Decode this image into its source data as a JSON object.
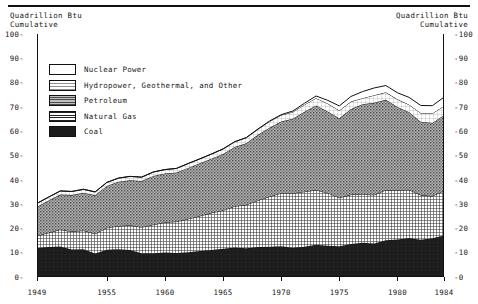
{
  "axis_titles": {
    "left": "Quadrillion Btu\nCumulative",
    "right": "Quadrillion Btu\nCumulative"
  },
  "y_ticks_left": [
    "100-",
    "90-",
    "80-",
    "70-",
    "60-",
    "50-",
    "40-",
    "30-",
    "20-",
    "10-",
    "0-"
  ],
  "y_ticks_right": [
    "-100",
    "-90",
    "-80",
    "-70",
    "-60",
    "-50",
    "-40",
    "-30",
    "-20",
    "-10",
    "-0"
  ],
  "legend": {
    "items": [
      {
        "label": "Nuclear Power",
        "pattern": "blank",
        "color": "#ffffff"
      },
      {
        "label": "Hydropower, Geothermal, and Other",
        "pattern": "fine-grid",
        "color": "#f2f2f2"
      },
      {
        "label": "Petroleum",
        "pattern": "stipple-medium",
        "color": "#8c8c8c"
      },
      {
        "label": "Natural Gas",
        "pattern": "crosshatch-dense",
        "color": "#595959"
      },
      {
        "label": "Coal",
        "pattern": "solid",
        "color": "#1c1c1c"
      }
    ]
  },
  "chart_data": {
    "type": "area",
    "title": "",
    "subtitle": "",
    "xlabel": "",
    "ylabel": "Quadrillion Btu Cumulative",
    "stacked": true,
    "grid": false,
    "legend_position": "inside-top-left",
    "xlim": [
      1949,
      1984
    ],
    "ylim": [
      0,
      100
    ],
    "x_tick_labels": [
      "1949",
      "1955",
      "1960",
      "1965",
      "1970",
      "1975",
      "1980",
      "1984"
    ],
    "x_tick_values": [
      1949,
      1955,
      1960,
      1965,
      1970,
      1975,
      1980,
      1984
    ],
    "y_tick_values": [
      0,
      10,
      20,
      30,
      40,
      50,
      60,
      70,
      80,
      90,
      100
    ],
    "x": [
      1949,
      1950,
      1951,
      1952,
      1953,
      1954,
      1955,
      1956,
      1957,
      1958,
      1959,
      1960,
      1961,
      1962,
      1963,
      1964,
      1965,
      1966,
      1967,
      1968,
      1969,
      1970,
      1971,
      1972,
      1973,
      1974,
      1975,
      1976,
      1977,
      1978,
      1979,
      1980,
      1981,
      1982,
      1983,
      1984
    ],
    "series": [
      {
        "name": "Coal",
        "values": [
          11.9,
          12.3,
          12.6,
          11.3,
          11.4,
          9.7,
          11.2,
          11.4,
          11.1,
          9.8,
          9.8,
          10.1,
          9.9,
          10.2,
          10.7,
          11.1,
          11.6,
          12.1,
          11.8,
          12.3,
          12.4,
          12.7,
          12.0,
          12.4,
          13.3,
          12.9,
          12.7,
          13.6,
          14.1,
          13.8,
          15.1,
          15.4,
          16.0,
          15.3,
          15.9,
          17.1
        ]
      },
      {
        "name": "Natural Gas",
        "values": [
          5.1,
          5.9,
          6.9,
          7.4,
          7.7,
          8.1,
          9.0,
          9.6,
          10.2,
          10.7,
          11.7,
          12.4,
          12.9,
          13.7,
          14.4,
          15.3,
          15.8,
          17.0,
          17.9,
          19.2,
          20.7,
          21.8,
          22.5,
          22.7,
          22.5,
          21.7,
          19.9,
          20.3,
          19.9,
          20.0,
          20.7,
          20.4,
          19.9,
          18.4,
          17.4,
          18.4
        ]
      },
      {
        "name": "Petroleum",
        "values": [
          11.9,
          13.3,
          14.4,
          15.0,
          15.6,
          15.8,
          17.3,
          18.2,
          18.5,
          19.0,
          20.1,
          20.1,
          20.2,
          21.0,
          21.7,
          22.3,
          23.2,
          24.4,
          25.3,
          27.0,
          28.3,
          29.5,
          30.6,
          32.9,
          34.8,
          33.5,
          32.7,
          35.2,
          37.1,
          37.9,
          37.1,
          34.2,
          31.9,
          30.2,
          30.1,
          31.1
        ]
      },
      {
        "name": "Hydropower, Geothermal, and Other",
        "values": [
          1.4,
          1.4,
          1.5,
          1.5,
          1.4,
          1.4,
          1.4,
          1.5,
          1.6,
          1.6,
          1.6,
          1.6,
          1.7,
          1.8,
          1.8,
          1.9,
          2.1,
          2.1,
          2.3,
          2.3,
          2.6,
          2.6,
          2.8,
          2.9,
          3.0,
          3.3,
          3.2,
          3.1,
          2.5,
          3.1,
          3.1,
          3.1,
          3.1,
          3.6,
          3.9,
          3.8
        ]
      },
      {
        "name": "Nuclear Power",
        "values": [
          0.0,
          0.0,
          0.0,
          0.0,
          0.0,
          0.0,
          0.0,
          0.0,
          0.0,
          0.0,
          0.0,
          0.0,
          0.0,
          0.0,
          0.0,
          0.0,
          0.0,
          0.1,
          0.1,
          0.1,
          0.2,
          0.2,
          0.4,
          0.6,
          0.9,
          1.3,
          1.9,
          2.1,
          2.7,
          3.0,
          2.8,
          2.7,
          3.0,
          3.1,
          3.2,
          3.6
        ]
      }
    ]
  }
}
